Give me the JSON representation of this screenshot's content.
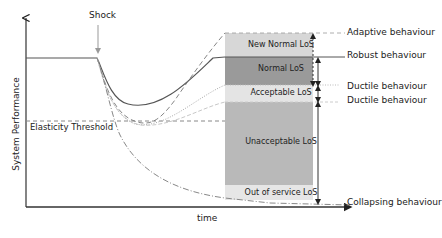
{
  "diagram": {
    "type": "resilience-performance-curve",
    "axes": {
      "ylabel": "System Performance",
      "xlabel": "time"
    },
    "event": {
      "label": "Shock"
    },
    "threshold": {
      "label": "Elasticity Threshold"
    },
    "bands": [
      {
        "id": "new-normal",
        "label": "New Normal LoS",
        "color": "#d7d7d7"
      },
      {
        "id": "normal",
        "label": "Normal LoS",
        "color": "#9a9a9a"
      },
      {
        "id": "acceptable",
        "label": "Acceptable LoS",
        "color": "#e4e4e4"
      },
      {
        "id": "unacceptable",
        "label": "Unacceptable LoS",
        "color": "#b9b9b9"
      },
      {
        "id": "out-of-service",
        "label": "Out of service LoS",
        "color": "#e6e6e6"
      }
    ],
    "behaviours": [
      {
        "label": "Adaptive behaviour",
        "line": "dashed"
      },
      {
        "label": "Robust behaviour",
        "line": "solid"
      },
      {
        "label": "Ductile behaviour",
        "line": "dotted"
      },
      {
        "label": "Ductile behaviour",
        "line": "dotted-light"
      },
      {
        "label": "Collapsing behaviour",
        "line": "dash-dot"
      }
    ]
  }
}
